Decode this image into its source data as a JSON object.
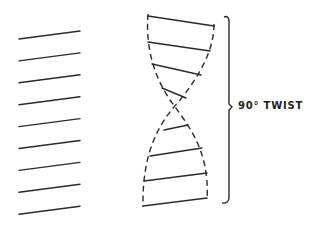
{
  "diagram": {
    "label": "90° TWIST",
    "stroke_color": "#2a2a2a",
    "parallel_lines": {
      "count": 9,
      "x_start": 19,
      "x_end": 80,
      "y_start_first": 39,
      "y_end_first": 31,
      "spacing": 21.9
    },
    "helix": {
      "rungs": [
        {
          "x1": 148,
          "y1": 16,
          "x2": 214,
          "y2": 26
        },
        {
          "x1": 148,
          "y1": 42,
          "x2": 210,
          "y2": 51
        },
        {
          "x1": 152,
          "y1": 64,
          "x2": 201,
          "y2": 75
        },
        {
          "x1": 162,
          "y1": 88,
          "x2": 186,
          "y2": 98
        },
        {
          "x1": 164,
          "y1": 130,
          "x2": 188,
          "y2": 125
        },
        {
          "x1": 150,
          "y1": 156,
          "x2": 202,
          "y2": 148
        },
        {
          "x1": 144,
          "y1": 181,
          "x2": 207,
          "y2": 173
        },
        {
          "x1": 143,
          "y1": 206,
          "x2": 207,
          "y2": 198
        }
      ]
    },
    "bracket": {
      "x": 229,
      "y_top": 15,
      "y_bottom": 203,
      "y_mid": 107
    }
  }
}
